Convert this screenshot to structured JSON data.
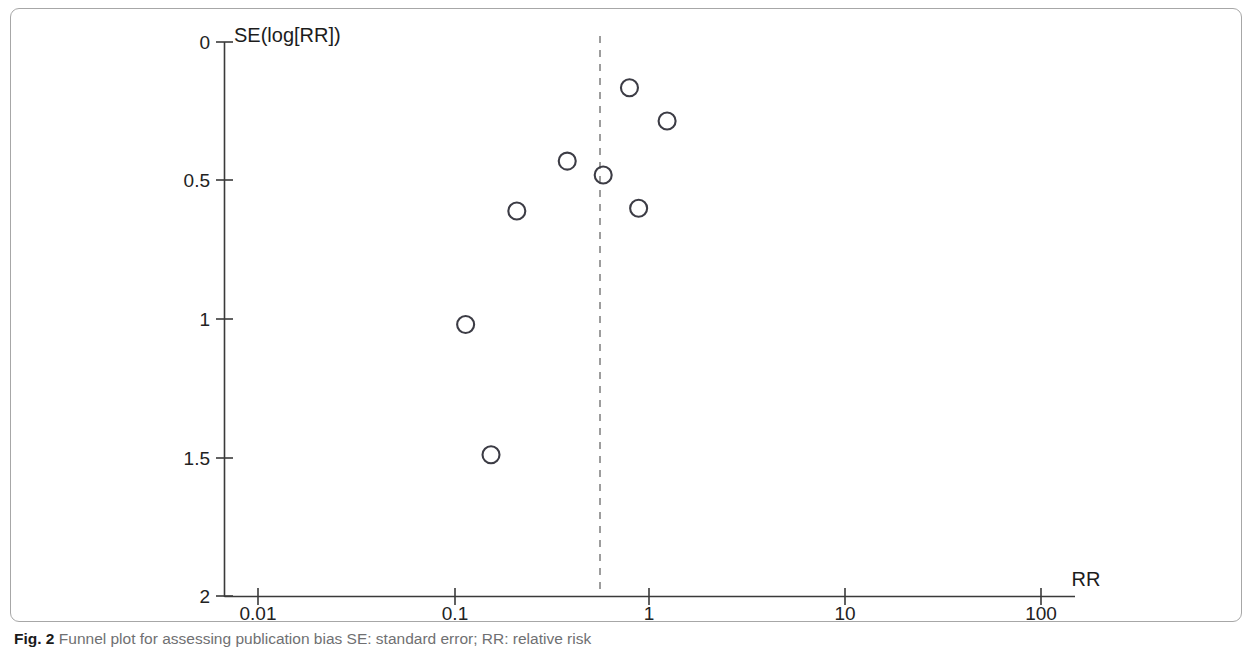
{
  "caption": {
    "label": "Fig. 2",
    "text": "Funnel plot for assessing publication bias SE: standard error; RR: relative risk"
  },
  "chart_data": {
    "type": "scatter",
    "title": "",
    "subtitle": "",
    "xlabel": "RR",
    "ylabel": "SE(log[RR])",
    "x_scale": "log",
    "y_scale": "linear",
    "y_inverted": true,
    "xlim": [
      0.01,
      100
    ],
    "ylim": [
      0,
      2
    ],
    "grid": false,
    "legend": null,
    "x_ticks": [
      {
        "value": 0.01,
        "label": "0.01"
      },
      {
        "value": 0.1,
        "label": "0.1"
      },
      {
        "value": 1,
        "label": "1"
      },
      {
        "value": 10,
        "label": "10"
      },
      {
        "value": 100,
        "label": "100"
      }
    ],
    "y_ticks": [
      {
        "value": 0,
        "label": "0"
      },
      {
        "value": 0.5,
        "label": "0.5"
      },
      {
        "value": 1,
        "label": "1"
      },
      {
        "value": 1.5,
        "label": "1.5"
      },
      {
        "value": 2,
        "label": "2"
      }
    ],
    "reference_line": {
      "type": "vertical-dashed",
      "x": 0.58,
      "label": "pooled effect estimate",
      "color": "#7d7d7d"
    },
    "marker": {
      "shape": "open-circle",
      "radius": 8.5,
      "stroke": "#3c3c45",
      "fill": "none"
    },
    "points": [
      {
        "rr": 0.79,
        "se": 0.165
      },
      {
        "rr": 1.23,
        "se": 0.285
      },
      {
        "rr": 0.38,
        "se": 0.43
      },
      {
        "rr": 0.58,
        "se": 0.48
      },
      {
        "rr": 0.21,
        "se": 0.61
      },
      {
        "rr": 0.88,
        "se": 0.6
      },
      {
        "rr": 0.115,
        "se": 1.02
      },
      {
        "rr": 0.155,
        "se": 1.49
      }
    ]
  }
}
